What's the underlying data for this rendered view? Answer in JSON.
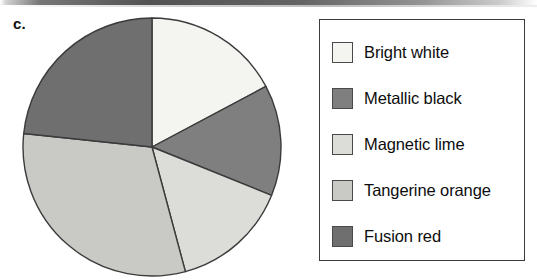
{
  "figure": {
    "label": "c."
  },
  "legend": {
    "items": [
      {
        "label": "Bright white",
        "color": "#f4f4f1"
      },
      {
        "label": "Metallic black",
        "color": "#7f7f7f"
      },
      {
        "label": "Magnetic lime",
        "color": "#dcdcd8"
      },
      {
        "label": "Tangerine orange",
        "color": "#c9c9c5"
      },
      {
        "label": "Fusion red",
        "color": "#6f6f6f"
      }
    ]
  },
  "chart_data": {
    "type": "pie",
    "title": "",
    "labels": [
      "Bright white",
      "Metallic black",
      "Magnetic lime",
      "Tangerine orange",
      "Fusion red"
    ],
    "values": [
      17,
      14,
      15,
      31,
      23
    ],
    "units": "percent",
    "colors": [
      "#f4f4f1",
      "#7f7f7f",
      "#dcdcd8",
      "#c9c9c5",
      "#6f6f6f"
    ],
    "start_angle_deg": 0,
    "direction": "clockwise",
    "slice_angles_deg": [
      62,
      50,
      53,
      111,
      84
    ],
    "legend_position": "right",
    "grid": false,
    "geometry": {
      "cx": 132,
      "cy": 131,
      "r": 129
    },
    "stroke": "#3b3b3b"
  }
}
